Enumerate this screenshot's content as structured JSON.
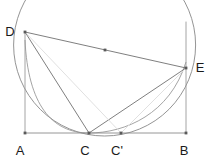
{
  "figure": {
    "background_color": "#ffffff",
    "width": 215,
    "height": 168,
    "stroke_colors": {
      "primary": "#767676",
      "secondary": "#9a9a9a",
      "faint": "#d2d2d2",
      "point": "#5a5a5a",
      "label": "#1a1a1a"
    },
    "points": [
      {
        "id": "A",
        "label": "A",
        "x": 25,
        "y": 133,
        "label_x": 20,
        "label_y": 152,
        "marked": true
      },
      {
        "id": "C",
        "label": "C",
        "x": 89,
        "y": 133,
        "label_x": 85,
        "label_y": 152,
        "marked": true
      },
      {
        "id": "Cp",
        "label": "C'",
        "x": 121,
        "y": 133,
        "label_x": 115,
        "label_y": 152,
        "marked": true
      },
      {
        "id": "B",
        "label": "B",
        "x": 186,
        "y": 133,
        "label_x": 183,
        "label_y": 152,
        "marked": true
      },
      {
        "id": "D",
        "label": "D",
        "x": 25,
        "y": 32,
        "label_x": 8,
        "label_y": 33,
        "marked": true
      },
      {
        "id": "E",
        "label": "E",
        "x": 186,
        "y": 68,
        "label_x": 197,
        "label_y": 69,
        "marked": true
      },
      {
        "id": "M",
        "label": "",
        "x": 105,
        "y": 50,
        "label_x": 0,
        "label_y": 0,
        "marked": true
      }
    ],
    "segments": [
      {
        "id": "AB",
        "from": "A",
        "to": "B",
        "weight": "primary"
      },
      {
        "id": "AD",
        "from": "A",
        "to": "D",
        "weight": "secondary"
      },
      {
        "id": "BE",
        "from": "B",
        "to": "E",
        "weight": "secondary"
      },
      {
        "id": "DE",
        "from": "D",
        "to": "E",
        "weight": "primary"
      },
      {
        "id": "DC",
        "from": "D",
        "to": "C",
        "weight": "primary"
      },
      {
        "id": "EC",
        "from": "E",
        "to": "C",
        "weight": "primary"
      },
      {
        "id": "DCp",
        "from": "D",
        "to": "Cp",
        "weight": "faint"
      },
      {
        "id": "ECp",
        "from": "E",
        "to": "Cp",
        "weight": "faint"
      }
    ],
    "arcs": [
      {
        "id": "big-circle",
        "description": "circle through D, C and E",
        "weight": "primary"
      },
      {
        "id": "lower-arc",
        "description": "arc from D through C' to B",
        "weight": "secondary"
      }
    ]
  }
}
